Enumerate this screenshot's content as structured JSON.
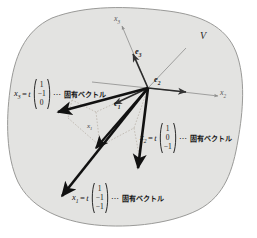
{
  "figure": {
    "space_label": "V",
    "background_color": "#e3e3e1",
    "outline_color": "#9a9a98",
    "axis_color": "#8d8d8b",
    "vector_color": "#111111",
    "dotted_color": "#b0a9a0"
  },
  "axes": [
    {
      "name": "axis-x3",
      "label": "x",
      "sub": "3"
    },
    {
      "name": "axis-x2",
      "label": "x",
      "sub": "2"
    }
  ],
  "basis_vectors": [
    {
      "name": "basis-e3",
      "label": "e",
      "sub": "3"
    },
    {
      "name": "basis-e2",
      "label": "e",
      "sub": "2"
    },
    {
      "name": "basis-e1",
      "label": "e",
      "sub": "1"
    }
  ],
  "inline_labels": [
    {
      "name": "vector-x1-tick",
      "label": "x",
      "sub": "1"
    }
  ],
  "equations": [
    {
      "name": "eigenvector-x3",
      "lhs": "x",
      "lhs_sub": "3",
      "equals": "=",
      "scalar": "t",
      "column": [
        "1",
        "−1",
        "0"
      ],
      "dots": "⋯",
      "note": "固有ベクトル"
    },
    {
      "name": "eigenvector-x2",
      "lhs": "x",
      "lhs_sub": "2",
      "equals": "=",
      "scalar": "t",
      "column": [
        "1",
        "0",
        "−1"
      ],
      "dots": "⋯",
      "note": "固有ベクトル"
    },
    {
      "name": "eigenvector-x1",
      "lhs": "x",
      "lhs_sub": "1",
      "equals": "=",
      "scalar": "t",
      "column": [
        "1",
        "−1",
        "−1"
      ],
      "dots": "⋯",
      "note": "固有ベクトル"
    }
  ]
}
